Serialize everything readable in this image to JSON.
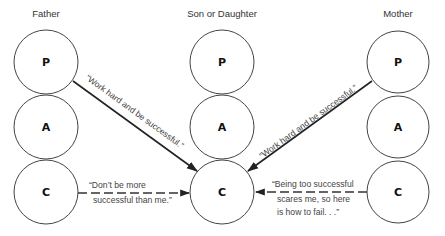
{
  "diagram": {
    "type": "transactional-analysis-script-diagram",
    "columns": [
      {
        "id": "father",
        "label": "Father",
        "cx": 46,
        "states": [
          "P",
          "A",
          "C"
        ]
      },
      {
        "id": "child",
        "label": "Son or Daughter",
        "cx": 222,
        "states": [
          "P",
          "A",
          "C"
        ]
      },
      {
        "id": "mother",
        "label": "Mother",
        "cx": 398,
        "states": [
          "P",
          "A",
          "C"
        ]
      }
    ],
    "ego_states": {
      "P": "Parent",
      "A": "Adult",
      "C": "Child"
    },
    "messages": [
      {
        "id": "father-p-to-child-c",
        "from": "father.P",
        "to": "child.C",
        "style": "solid",
        "text": "“Work hard and be successful.”"
      },
      {
        "id": "mother-p-to-child-c",
        "from": "mother.P",
        "to": "child.C",
        "style": "solid",
        "text": "“Work hard and be successful.”"
      },
      {
        "id": "father-c-to-child-c",
        "from": "father.C",
        "to": "child.C",
        "style": "dashed",
        "lines": [
          "“Don’t be more",
          "successful than me.”"
        ]
      },
      {
        "id": "mother-c-to-child-c",
        "from": "mother.C",
        "to": "child.C",
        "style": "dashed",
        "lines": [
          "“Being too successful",
          "scares me, so here",
          "is how to fail. . .”"
        ]
      }
    ],
    "colors": {
      "stroke": "#444444",
      "arrow": "#222222",
      "text": "#444444",
      "background": "#ffffff"
    }
  }
}
